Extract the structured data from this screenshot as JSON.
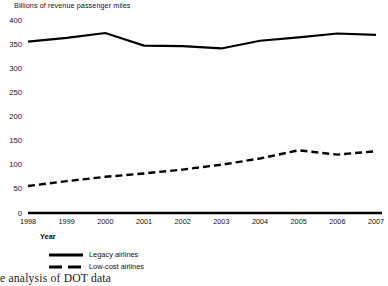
{
  "chart_data": {
    "type": "line",
    "title": "",
    "ylabel": "Billions of revenue passenger miles",
    "xlabel": "Year",
    "categories": [
      "1998",
      "1999",
      "2000",
      "2001",
      "2002",
      "2003",
      "2004",
      "2005",
      "2006",
      "2007"
    ],
    "x": [
      1998,
      1999,
      2000,
      2001,
      2002,
      2003,
      2004,
      2005,
      2006,
      2007
    ],
    "ylim": [
      0,
      400
    ],
    "yticks": [
      0,
      50,
      100,
      150,
      200,
      250,
      300,
      350,
      400
    ],
    "ytick_labels": [
      "0",
      "50",
      "100",
      "150",
      "200",
      "250",
      "300",
      "350",
      "400"
    ],
    "grid": false,
    "legend_position": "below-left",
    "series": [
      {
        "name": "Legacy airlines",
        "style": "solid",
        "color": "#000000",
        "values": [
          355,
          363,
          373,
          347,
          346,
          341,
          357,
          364,
          372,
          369
        ]
      },
      {
        "name": "Low-cost airlines",
        "style": "dashed",
        "color": "#000000",
        "values": [
          56,
          66,
          75,
          82,
          90,
          100,
          113,
          130,
          121,
          128
        ]
      }
    ]
  },
  "legend": {
    "items": [
      {
        "label": "Legacy airlines",
        "style": "solid"
      },
      {
        "label": "Low-cost airlines",
        "style": "dashed"
      }
    ]
  },
  "footer": {
    "source_note": "e analysis of DOT data"
  }
}
